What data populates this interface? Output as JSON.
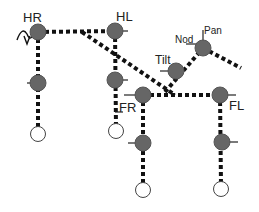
{
  "colors": {
    "joint_fill": "#666666",
    "joint_stroke": "#555555",
    "foot_fill": "#ffffff",
    "foot_stroke": "#444444",
    "link": "#111111",
    "label": "#222222"
  },
  "labels": {
    "hr": "HR",
    "hl": "HL",
    "fr": "FR",
    "fl": "FL",
    "tilt": "Tilt",
    "nod": "Nod",
    "pan": "Pan"
  },
  "joints": [
    {
      "id": "hr-hip",
      "x": 38,
      "y": 32
    },
    {
      "id": "hr-knee",
      "x": 38,
      "y": 83
    },
    {
      "id": "hl-hip",
      "x": 115,
      "y": 31
    },
    {
      "id": "hl-knee",
      "x": 115,
      "y": 80
    },
    {
      "id": "fr-shoulder",
      "x": 143,
      "y": 95
    },
    {
      "id": "fr-elbow",
      "x": 143,
      "y": 143
    },
    {
      "id": "fl-shoulder",
      "x": 220,
      "y": 95
    },
    {
      "id": "fl-elbow",
      "x": 222,
      "y": 142
    },
    {
      "id": "tilt-joint",
      "x": 176,
      "y": 71
    },
    {
      "id": "pan-joint",
      "x": 203,
      "y": 48
    }
  ],
  "feet": [
    {
      "id": "hr-foot",
      "x": 38,
      "y": 134
    },
    {
      "id": "hl-foot",
      "x": 116,
      "y": 131
    },
    {
      "id": "fr-foot",
      "x": 143,
      "y": 190
    },
    {
      "id": "fl-foot",
      "x": 221,
      "y": 189
    }
  ]
}
